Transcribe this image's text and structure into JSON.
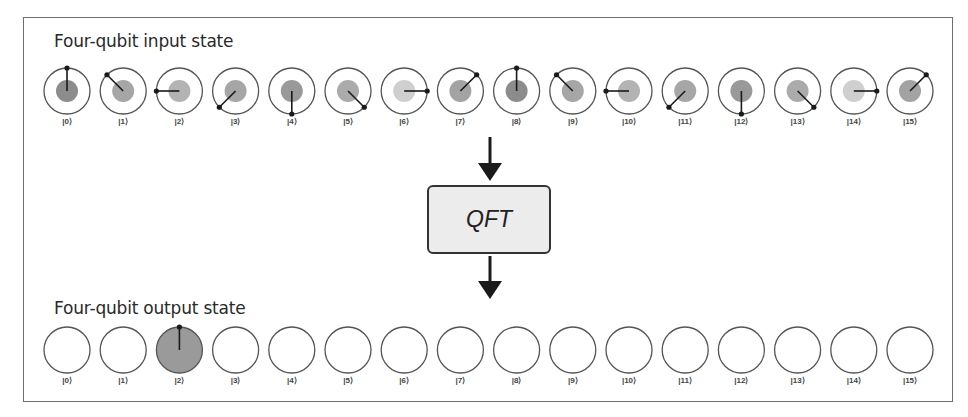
{
  "input_section": {
    "title": "Four-qubit input state",
    "states": [
      {
        "label": "|0⟩",
        "magnitude": 1,
        "phase_deg": 90,
        "shade": "#8c8c8c"
      },
      {
        "label": "|1⟩",
        "magnitude": 1,
        "phase_deg": 135,
        "shade": "#a6a6a6"
      },
      {
        "label": "|2⟩",
        "magnitude": 1,
        "phase_deg": 180,
        "shade": "#b3b3b3"
      },
      {
        "label": "|3⟩",
        "magnitude": 1,
        "phase_deg": 225,
        "shade": "#a6a6a6"
      },
      {
        "label": "|4⟩",
        "magnitude": 1,
        "phase_deg": 270,
        "shade": "#999999"
      },
      {
        "label": "|5⟩",
        "magnitude": 1,
        "phase_deg": 315,
        "shade": "#ababab"
      },
      {
        "label": "|6⟩",
        "magnitude": 1,
        "phase_deg": 0,
        "shade": "#cfcfcf"
      },
      {
        "label": "|7⟩",
        "magnitude": 1,
        "phase_deg": 45,
        "shade": "#a3a3a3"
      },
      {
        "label": "|8⟩",
        "magnitude": 1,
        "phase_deg": 90,
        "shade": "#8c8c8c"
      },
      {
        "label": "|9⟩",
        "magnitude": 1,
        "phase_deg": 135,
        "shade": "#a6a6a6"
      },
      {
        "label": "|10⟩",
        "magnitude": 1,
        "phase_deg": 180,
        "shade": "#b3b3b3"
      },
      {
        "label": "|11⟩",
        "magnitude": 1,
        "phase_deg": 225,
        "shade": "#a6a6a6"
      },
      {
        "label": "|12⟩",
        "magnitude": 1,
        "phase_deg": 270,
        "shade": "#999999"
      },
      {
        "label": "|13⟩",
        "magnitude": 1,
        "phase_deg": 315,
        "shade": "#ababab"
      },
      {
        "label": "|14⟩",
        "magnitude": 1,
        "phase_deg": 0,
        "shade": "#cfcfcf"
      },
      {
        "label": "|15⟩",
        "magnitude": 1,
        "phase_deg": 45,
        "shade": "#a3a3a3"
      }
    ]
  },
  "operation": {
    "label": "QFT",
    "box_fill": "#ececec",
    "box_stroke": "#333333"
  },
  "output_section": {
    "title": "Four-qubit output state",
    "states": [
      {
        "label": "|0⟩",
        "magnitude": 0
      },
      {
        "label": "|1⟩",
        "magnitude": 0
      },
      {
        "label": "|2⟩",
        "magnitude": 1,
        "phase_deg": 90,
        "shade": "#9a9a9a"
      },
      {
        "label": "|3⟩",
        "magnitude": 0
      },
      {
        "label": "|4⟩",
        "magnitude": 0
      },
      {
        "label": "|5⟩",
        "magnitude": 0
      },
      {
        "label": "|6⟩",
        "magnitude": 0
      },
      {
        "label": "|7⟩",
        "magnitude": 0
      },
      {
        "label": "|8⟩",
        "magnitude": 0
      },
      {
        "label": "|9⟩",
        "magnitude": 0
      },
      {
        "label": "|10⟩",
        "magnitude": 0
      },
      {
        "label": "|11⟩",
        "magnitude": 0
      },
      {
        "label": "|12⟩",
        "magnitude": 0
      },
      {
        "label": "|13⟩",
        "magnitude": 0
      },
      {
        "label": "|14⟩",
        "magnitude": 0
      },
      {
        "label": "|15⟩",
        "magnitude": 0
      }
    ]
  },
  "colors": {
    "frame": "#6e6e6e",
    "circle_stroke": "#555555",
    "phase_line": "#1a1a1a",
    "arrow": "#1a1a1a"
  }
}
